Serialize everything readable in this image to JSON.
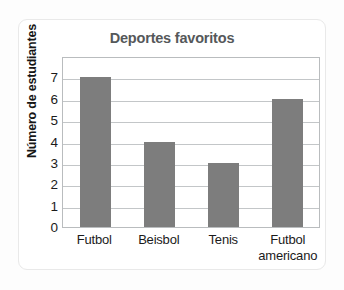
{
  "chart_data": {
    "type": "bar",
    "title": "Deportes favoritos",
    "xlabel": "",
    "ylabel": "Número de estudiantes",
    "categories": [
      "Futbol",
      "Beisbol",
      "Tenis",
      "Futbol americano"
    ],
    "category_lines": [
      {
        "line1": "Futbol",
        "line2": ""
      },
      {
        "line1": "Beisbol",
        "line2": ""
      },
      {
        "line1": "Tenis",
        "line2": ""
      },
      {
        "line1": "Futbol",
        "line2": "americano"
      }
    ],
    "values": [
      7,
      4,
      3,
      6
    ],
    "ylim": [
      0,
      8
    ],
    "yticks": [
      7,
      6,
      5,
      4,
      3,
      2,
      1,
      0
    ],
    "grid": true,
    "legend": "none",
    "colors": {
      "bar": "#7d7d7d",
      "title": "#55585a",
      "axis_title": "#161616",
      "gridline": "#c3c6c8",
      "frame": "#b9bcbe",
      "card_border": "#e9e9e9",
      "background": "#ffffff"
    }
  }
}
